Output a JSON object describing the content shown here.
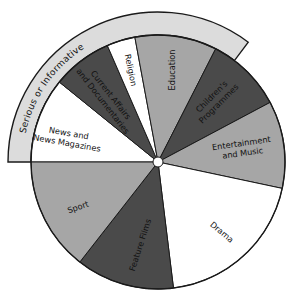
{
  "diagram": {
    "type": "pie-wheel",
    "center": [
      158,
      162
    ],
    "radius": 127,
    "hub_radius": 5,
    "band": {
      "label_words": [
        "Serious",
        "or",
        "Informative"
      ],
      "inner_radius": 127,
      "outer_radius": 150,
      "start_angle": 270,
      "end_angle": 37,
      "fill": "#dcdcdc"
    },
    "slices": [
      {
        "label_lines": [
          "News and",
          "News Magazines"
        ],
        "start": 270,
        "end": 309,
        "fill": "#ffffff",
        "label_pos": [
          68,
          138
        ],
        "label_rotate": 10
      },
      {
        "label_lines": [
          "Current Affairs",
          "and Documentaries"
        ],
        "start": 309,
        "end": 336.5,
        "fill": "#4a4a4a",
        "label_pos": [
          107,
          98
        ],
        "label_rotate": 52
      },
      {
        "label_lines": [
          "Religion"
        ],
        "start": 336.5,
        "end": 349.5,
        "fill": "#ffffff",
        "label_pos": [
          131,
          70
        ],
        "label_rotate": 78
      },
      {
        "label_lines": [
          "Education"
        ],
        "start": 349.5,
        "end": 27,
        "fill": "#a6a6a6",
        "label_pos": [
          172,
          70
        ],
        "label_rotate": -90
      },
      {
        "label_lines": [
          "Children's",
          "Programmes"
        ],
        "start": 27,
        "end": 62,
        "fill": "#4a4a4a",
        "label_pos": [
          215,
          100
        ],
        "label_rotate": -45
      },
      {
        "label_lines": [
          "Entertainment",
          "and Music"
        ],
        "start": 62,
        "end": 102,
        "fill": "#a6a6a6",
        "label_pos": [
          242,
          148
        ],
        "label_rotate": -8
      },
      {
        "label_lines": [
          "Drama"
        ],
        "start": 102,
        "end": 173,
        "fill": "#ffffff",
        "label_pos": [
          222,
          232
        ],
        "label_rotate": 40
      },
      {
        "label_lines": [
          "Feature Films"
        ],
        "start": 173,
        "end": 218,
        "fill": "#4a4a4a",
        "label_pos": [
          140,
          245
        ],
        "label_rotate": -72
      },
      {
        "label_lines": [
          "Sport"
        ],
        "start": 218,
        "end": 270,
        "fill": "#a6a6a6",
        "label_pos": [
          78,
          207
        ],
        "label_rotate": -20
      }
    ],
    "stroke": "#1a1a1a"
  }
}
